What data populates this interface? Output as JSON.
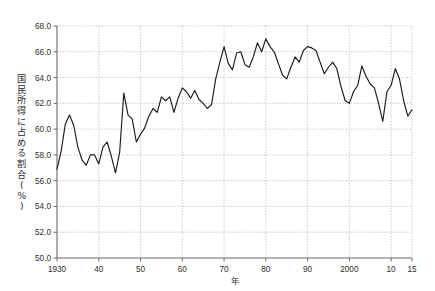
{
  "chart_data": {
    "type": "line",
    "title": "",
    "xlabel": "年",
    "ylabel": "国民所得に占める割合(%)",
    "ylim": [
      50.0,
      68.0
    ],
    "xlim": [
      1930,
      2015
    ],
    "grid": true,
    "legend": "none",
    "ytick_labels": [
      "68.0",
      "66.0",
      "64.0",
      "62.0",
      "60.0",
      "58.0",
      "56.0",
      "54.0",
      "52.0",
      "50.0"
    ],
    "ytick_values": [
      68.0,
      66.0,
      64.0,
      62.0,
      60.0,
      58.0,
      56.0,
      54.0,
      52.0,
      50.0
    ],
    "xtick_labels": [
      "1930",
      "40",
      "50",
      "60",
      "70",
      "80",
      "90",
      "2000",
      "10",
      "15"
    ],
    "xtick_values": [
      1930,
      1940,
      1950,
      1960,
      1970,
      1980,
      1990,
      2000,
      2010,
      2015
    ],
    "series": [
      {
        "name": "国民所得に占める割合",
        "color": "#1a1a1a",
        "x": [
          1930,
          1931,
          1932,
          1933,
          1934,
          1935,
          1936,
          1937,
          1938,
          1939,
          1940,
          1941,
          1942,
          1943,
          1944,
          1945,
          1946,
          1947,
          1948,
          1949,
          1950,
          1951,
          1952,
          1953,
          1954,
          1955,
          1956,
          1957,
          1958,
          1959,
          1960,
          1961,
          1962,
          1963,
          1964,
          1965,
          1966,
          1967,
          1968,
          1969,
          1970,
          1971,
          1972,
          1973,
          1974,
          1975,
          1976,
          1977,
          1978,
          1979,
          1980,
          1981,
          1982,
          1983,
          1984,
          1985,
          1986,
          1987,
          1988,
          1989,
          1990,
          1991,
          1992,
          1993,
          1994,
          1995,
          1996,
          1997,
          1998,
          1999,
          2000,
          2001,
          2002,
          2003,
          2004,
          2005,
          2006,
          2007,
          2008,
          2009,
          2010,
          2011,
          2012,
          2013,
          2014,
          2015
        ],
        "values": [
          56.9,
          58.3,
          60.4,
          61.1,
          60.3,
          58.6,
          57.6,
          57.2,
          58.0,
          58.0,
          57.3,
          58.6,
          59.0,
          57.9,
          56.6,
          58.2,
          62.8,
          61.1,
          60.8,
          59.0,
          59.6,
          60.1,
          61.0,
          61.6,
          61.3,
          62.5,
          62.2,
          62.5,
          61.3,
          62.4,
          63.2,
          62.9,
          62.4,
          63.0,
          62.3,
          62.0,
          61.6,
          61.9,
          63.9,
          65.2,
          66.4,
          65.1,
          64.6,
          65.9,
          66.0,
          65.0,
          64.8,
          65.6,
          66.7,
          66.0,
          67.0,
          66.4,
          66.0,
          65.1,
          64.2,
          63.9,
          64.8,
          65.6,
          65.2,
          66.1,
          66.4,
          66.3,
          66.1,
          65.2,
          64.3,
          64.8,
          65.2,
          64.7,
          63.3,
          62.2,
          62.0,
          62.9,
          63.4,
          64.9,
          64.1,
          63.5,
          63.2,
          62.0,
          60.6,
          62.9,
          63.4,
          64.7,
          63.9,
          62.2,
          61.0,
          61.5
        ]
      }
    ]
  },
  "axis": {
    "y_label_chars": [
      "国",
      "民",
      "所",
      "得",
      "に",
      "占",
      "め",
      "る",
      "割",
      "合",
      "(",
      "%",
      ")"
    ],
    "x_label": "年"
  }
}
